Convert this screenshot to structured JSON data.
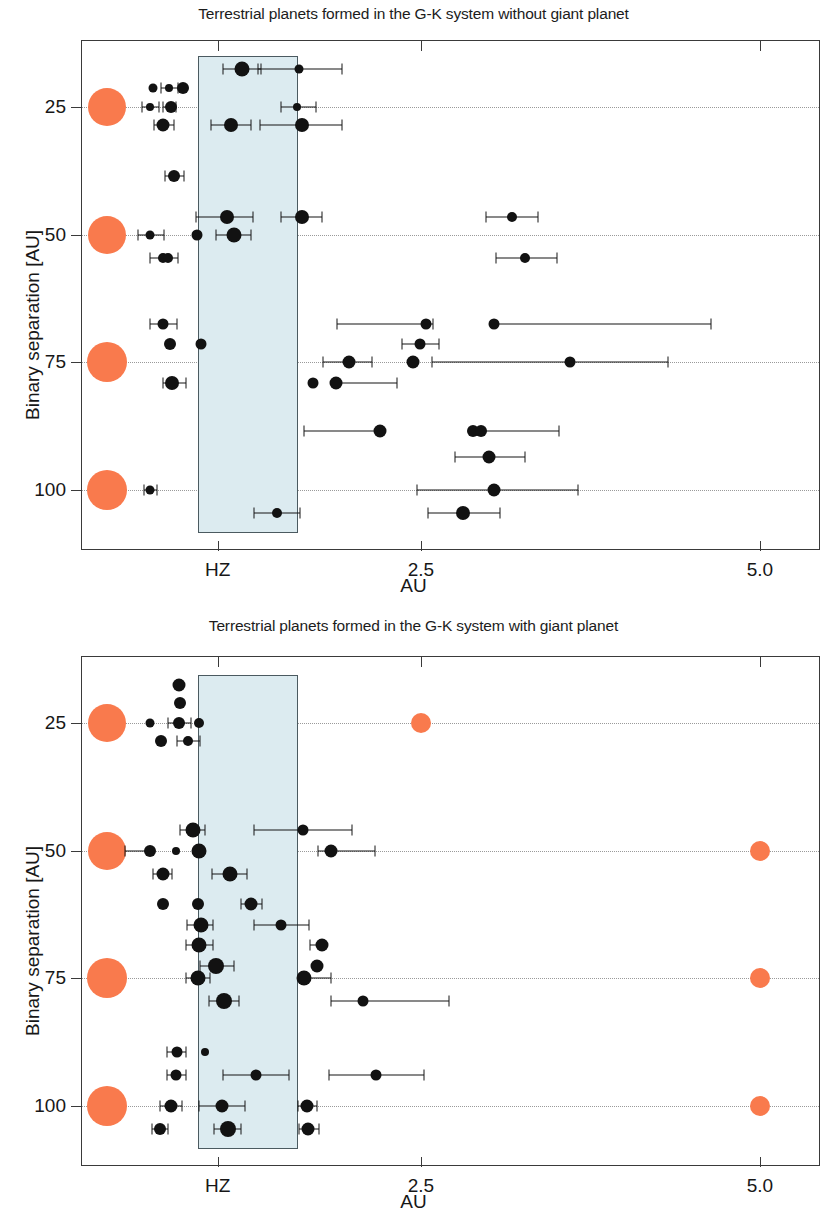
{
  "figure": {
    "axis": {
      "xlabel": "AU",
      "ylabel": "Binary separation [AU]",
      "xticks": [
        {
          "label": "HZ",
          "value": 1.0
        },
        {
          "label": "2.5",
          "value": 2.5
        },
        {
          "label": "5.0",
          "value": 5.0
        }
      ],
      "yticks": [
        {
          "label": "25",
          "value": 25
        },
        {
          "label": "50",
          "value": 50
        },
        {
          "label": "75",
          "value": 75
        },
        {
          "label": "100",
          "value": 100
        }
      ]
    },
    "colors": {
      "giant_planet": "#f97a4d",
      "habitable_zone_fill": "#dcebf0",
      "habitable_zone_border": "#4b5a60",
      "terrestrial_planet": "#121212",
      "axis": "#3a3a3a",
      "gridline": "#9a9a9a"
    }
  },
  "chart_data": [
    {
      "type": "scatter",
      "title": "Terrestrial planets formed in the G-K system without giant planet",
      "xlabel": "AU",
      "ylabel": "Binary separation [AU]",
      "xlim": [
        0.0,
        5.45
      ],
      "ylim": [
        112.0,
        12.0
      ],
      "grid": true,
      "legend": null,
      "habitable_zone": {
        "xmin": 0.855,
        "xmax": 1.59,
        "ymin": 15.0,
        "ymax": 108.5
      },
      "series": [
        {
          "name": "central star",
          "marker": "circle",
          "color": "#f97a4d",
          "points": [
            {
              "x": 0.185,
              "y": 25,
              "r": 19
            },
            {
              "x": 0.185,
              "y": 50,
              "r": 19
            },
            {
              "x": 0.185,
              "y": 75,
              "r": 20
            },
            {
              "x": 0.185,
              "y": 100,
              "r": 20
            }
          ]
        },
        {
          "name": "terrestrial planets",
          "marker": "circle",
          "color": "#121212",
          "points": [
            {
              "x": 1.18,
              "y": 17.5,
              "r": 7.5,
              "xerr_lo": 0.14,
              "xerr_hi": 0.14
            },
            {
              "x": 1.6,
              "y": 17.5,
              "r": 4.5,
              "xerr_lo": 0.3,
              "xerr_hi": 0.32
            },
            {
              "x": 0.525,
              "y": 21.2,
              "r": 4.5,
              "xerr_lo": 0.0,
              "xerr_hi": 0.0
            },
            {
              "x": 0.645,
              "y": 21.2,
              "r": 4.0,
              "xerr_lo": 0.06,
              "xerr_hi": 0.06
            },
            {
              "x": 0.745,
              "y": 21.2,
              "r": 6.0,
              "xerr_lo": 0.0,
              "xerr_hi": 0.0
            },
            {
              "x": 0.5,
              "y": 25,
              "r": 4.0,
              "xerr_lo": 0.06,
              "xerr_hi": 0.07
            },
            {
              "x": 0.655,
              "y": 25,
              "r": 6.0,
              "xerr_lo": 0.06,
              "xerr_hi": 0.04
            },
            {
              "x": 1.585,
              "y": 25,
              "r": 4.0,
              "xerr_lo": 0.12,
              "xerr_hi": 0.14
            },
            {
              "x": 0.6,
              "y": 28.5,
              "r": 6.5,
              "xerr_lo": 0.07,
              "xerr_hi": 0.08
            },
            {
              "x": 1.1,
              "y": 28.5,
              "r": 7.0,
              "xerr_lo": 0.15,
              "xerr_hi": 0.15
            },
            {
              "x": 1.62,
              "y": 28.5,
              "r": 7.0,
              "xerr_lo": 0.31,
              "xerr_hi": 0.3
            },
            {
              "x": 0.68,
              "y": 38.5,
              "r": 6.0,
              "xerr_lo": 0.07,
              "xerr_hi": 0.07
            },
            {
              "x": 1.07,
              "y": 46.5,
              "r": 7.0,
              "xerr_lo": 0.23,
              "xerr_hi": 0.19
            },
            {
              "x": 1.62,
              "y": 46.5,
              "r": 7.0,
              "xerr_lo": 0.15,
              "xerr_hi": 0.15
            },
            {
              "x": 3.17,
              "y": 46.5,
              "r": 5.0,
              "xerr_lo": 0.19,
              "xerr_hi": 0.19
            },
            {
              "x": 0.505,
              "y": 50,
              "r": 4.5,
              "xerr_lo": 0.09,
              "xerr_hi": 0.1
            },
            {
              "x": 0.845,
              "y": 50,
              "r": 5.5,
              "xerr_lo": 0.0,
              "xerr_hi": 0.0
            },
            {
              "x": 1.12,
              "y": 50,
              "r": 7.5,
              "xerr_lo": 0.13,
              "xerr_hi": 0.13
            },
            {
              "x": 0.6,
              "y": 54.5,
              "r": 5.0,
              "xerr_lo": 0.1,
              "xerr_hi": 0.11
            },
            {
              "x": 0.635,
              "y": 54.5,
              "r": 5.0,
              "xerr_lo": 0.0,
              "xerr_hi": 0.0
            },
            {
              "x": 3.27,
              "y": 54.5,
              "r": 5.0,
              "xerr_lo": 0.22,
              "xerr_hi": 0.23
            },
            {
              "x": 0.6,
              "y": 67.5,
              "r": 5.5,
              "xerr_lo": 0.1,
              "xerr_hi": 0.1
            },
            {
              "x": 2.54,
              "y": 67.5,
              "r": 5.5,
              "xerr_lo": 0.66,
              "xerr_hi": 0.05
            },
            {
              "x": 3.04,
              "y": 67.5,
              "r": 5.5,
              "xerr_lo": 0.0,
              "xerr_hi": 1.6
            },
            {
              "x": 0.65,
              "y": 71.5,
              "r": 6.0,
              "xerr_lo": 0.0,
              "xerr_hi": 0.0
            },
            {
              "x": 0.88,
              "y": 71.5,
              "r": 5.5,
              "xerr_lo": 0.0,
              "xerr_hi": 0.0
            },
            {
              "x": 2.49,
              "y": 71.5,
              "r": 5.5,
              "xerr_lo": 0.13,
              "xerr_hi": 0.14
            },
            {
              "x": 1.97,
              "y": 75,
              "r": 6.5,
              "xerr_lo": 0.19,
              "xerr_hi": 0.17
            },
            {
              "x": 2.44,
              "y": 75,
              "r": 6.5,
              "xerr_lo": 0.0,
              "xerr_hi": 0.0
            },
            {
              "x": 3.6,
              "y": 75,
              "r": 5.5,
              "xerr_lo": 1.02,
              "xerr_hi": 0.72
            },
            {
              "x": 0.665,
              "y": 79.0,
              "r": 7.0,
              "xerr_lo": 0.07,
              "xerr_hi": 0.1
            },
            {
              "x": 1.7,
              "y": 79.0,
              "r": 5.5,
              "xerr_lo": 0.0,
              "xerr_hi": 0.0
            },
            {
              "x": 1.87,
              "y": 79.0,
              "r": 6.5,
              "xerr_lo": 0.0,
              "xerr_hi": 0.45
            },
            {
              "x": 2.2,
              "y": 88.5,
              "r": 6.5,
              "xerr_lo": 0.56,
              "xerr_hi": 0.0
            },
            {
              "x": 2.88,
              "y": 88.5,
              "r": 6.0,
              "xerr_lo": 0.0,
              "xerr_hi": 0.0
            },
            {
              "x": 2.94,
              "y": 88.5,
              "r": 6.0,
              "xerr_lo": 0.0,
              "xerr_hi": 0.58
            },
            {
              "x": 3.0,
              "y": 93.5,
              "r": 6.5,
              "xerr_lo": 0.25,
              "xerr_hi": 0.27
            },
            {
              "x": 0.505,
              "y": 100,
              "r": 4.5,
              "xerr_lo": 0.05,
              "xerr_hi": 0.05
            },
            {
              "x": 3.04,
              "y": 100,
              "r": 6.5,
              "xerr_lo": 0.57,
              "xerr_hi": 0.62
            },
            {
              "x": 1.44,
              "y": 104.5,
              "r": 5.0,
              "xerr_lo": 0.17,
              "xerr_hi": 0.17
            },
            {
              "x": 2.81,
              "y": 104.5,
              "r": 7.0,
              "xerr_lo": 0.26,
              "xerr_hi": 0.27
            }
          ]
        }
      ]
    },
    {
      "type": "scatter",
      "title": "Terrestrial planets formed in the G-K system with giant planet",
      "xlabel": "AU",
      "ylabel": "Binary separation [AU]",
      "xlim": [
        0.0,
        5.45
      ],
      "ylim": [
        112.0,
        12.0
      ],
      "grid": true,
      "legend": null,
      "habitable_zone": {
        "xmin": 0.855,
        "xmax": 1.59,
        "ymin": 15.5,
        "ymax": 108.5
      },
      "series": [
        {
          "name": "central star",
          "marker": "circle",
          "color": "#f97a4d",
          "points": [
            {
              "x": 0.185,
              "y": 25,
              "r": 19
            },
            {
              "x": 0.185,
              "y": 50,
              "r": 19
            },
            {
              "x": 0.185,
              "y": 75,
              "r": 20
            },
            {
              "x": 0.185,
              "y": 100,
              "r": 20
            }
          ]
        },
        {
          "name": "giant planets",
          "marker": "circle",
          "color": "#f97a4d",
          "points": [
            {
              "x": 2.5,
              "y": 25,
              "r": 10
            },
            {
              "x": 5.0,
              "y": 50,
              "r": 10
            },
            {
              "x": 5.0,
              "y": 75,
              "r": 10
            },
            {
              "x": 5.0,
              "y": 100,
              "r": 10
            }
          ]
        },
        {
          "name": "terrestrial planets",
          "marker": "circle",
          "color": "#121212",
          "points": [
            {
              "x": 0.715,
              "y": 17.5,
              "r": 6.5,
              "xerr_lo": 0.0,
              "xerr_hi": 0.0
            },
            {
              "x": 0.725,
              "y": 21.0,
              "r": 6.0,
              "xerr_lo": 0.0,
              "xerr_hi": 0.0
            },
            {
              "x": 0.5,
              "y": 25,
              "r": 4.5,
              "xerr_lo": 0.0,
              "xerr_hi": 0.0
            },
            {
              "x": 0.715,
              "y": 25,
              "r": 6.0,
              "xerr_lo": 0.08,
              "xerr_hi": 0.09
            },
            {
              "x": 0.86,
              "y": 25,
              "r": 5.0,
              "xerr_lo": 0.0,
              "xerr_hi": 0.0
            },
            {
              "x": 0.585,
              "y": 28.5,
              "r": 6.0,
              "xerr_lo": 0.0,
              "xerr_hi": 0.0
            },
            {
              "x": 0.78,
              "y": 28.5,
              "r": 5.0,
              "xerr_lo": 0.08,
              "xerr_hi": 0.09
            },
            {
              "x": 0.815,
              "y": 46.0,
              "r": 7.5,
              "xerr_lo": 0.09,
              "xerr_hi": 0.09
            },
            {
              "x": 1.63,
              "y": 46.0,
              "r": 5.5,
              "xerr_lo": 0.36,
              "xerr_hi": 0.36
            },
            {
              "x": 0.5,
              "y": 50,
              "r": 6.0,
              "xerr_lo": 0.18,
              "xerr_hi": 0.0
            },
            {
              "x": 0.695,
              "y": 50,
              "r": 4.0,
              "xerr_lo": 0.0,
              "xerr_hi": 0.0
            },
            {
              "x": 0.865,
              "y": 50,
              "r": 7.5,
              "xerr_lo": 0.0,
              "xerr_hi": 0.0
            },
            {
              "x": 1.84,
              "y": 50,
              "r": 6.5,
              "xerr_lo": 0.1,
              "xerr_hi": 0.32
            },
            {
              "x": 0.595,
              "y": 54.5,
              "r": 6.5,
              "xerr_lo": 0.07,
              "xerr_hi": 0.07
            },
            {
              "x": 1.09,
              "y": 54.5,
              "r": 7.5,
              "xerr_lo": 0.13,
              "xerr_hi": 0.13
            },
            {
              "x": 0.6,
              "y": 60.5,
              "r": 6.0,
              "xerr_lo": 0.0,
              "xerr_hi": 0.0
            },
            {
              "x": 0.855,
              "y": 60.5,
              "r": 6.0,
              "xerr_lo": 0.0,
              "xerr_hi": 0.0
            },
            {
              "x": 1.245,
              "y": 60.5,
              "r": 6.5,
              "xerr_lo": 0.07,
              "xerr_hi": 0.08
            },
            {
              "x": 0.875,
              "y": 64.5,
              "r": 7.5,
              "xerr_lo": 0.1,
              "xerr_hi": 0.09
            },
            {
              "x": 1.465,
              "y": 64.5,
              "r": 5.5,
              "xerr_lo": 0.2,
              "xerr_hi": 0.21
            },
            {
              "x": 0.865,
              "y": 68.5,
              "r": 7.5,
              "xerr_lo": 0.1,
              "xerr_hi": 0.1
            },
            {
              "x": 1.77,
              "y": 68.5,
              "r": 6.5,
              "xerr_lo": 0.09,
              "xerr_hi": 0.0
            },
            {
              "x": 0.99,
              "y": 72.5,
              "r": 8.0,
              "xerr_lo": 0.12,
              "xerr_hi": 0.13
            },
            {
              "x": 1.73,
              "y": 72.5,
              "r": 6.5,
              "xerr_lo": 0.0,
              "xerr_hi": 0.0
            },
            {
              "x": 0.855,
              "y": 75,
              "r": 7.5,
              "xerr_lo": 0.09,
              "xerr_hi": 0.09
            },
            {
              "x": 1.64,
              "y": 75,
              "r": 7.5,
              "xerr_lo": 0.0,
              "xerr_hi": 0.2
            },
            {
              "x": 1.05,
              "y": 79.5,
              "r": 8.0,
              "xerr_lo": 0.11,
              "xerr_hi": 0.11
            },
            {
              "x": 2.07,
              "y": 79.5,
              "r": 5.5,
              "xerr_lo": 0.23,
              "xerr_hi": 0.64
            },
            {
              "x": 0.7,
              "y": 89.5,
              "r": 5.5,
              "xerr_lo": 0.07,
              "xerr_hi": 0.07
            },
            {
              "x": 0.905,
              "y": 89.5,
              "r": 4.0,
              "xerr_lo": 0.0,
              "xerr_hi": 0.0
            },
            {
              "x": 0.695,
              "y": 94.0,
              "r": 5.5,
              "xerr_lo": 0.07,
              "xerr_hi": 0.07
            },
            {
              "x": 1.28,
              "y": 94.0,
              "r": 5.5,
              "xerr_lo": 0.24,
              "xerr_hi": 0.25
            },
            {
              "x": 2.17,
              "y": 94.0,
              "r": 5.5,
              "xerr_lo": 0.35,
              "xerr_hi": 0.35
            },
            {
              "x": 0.655,
              "y": 100,
              "r": 6.5,
              "xerr_lo": 0.08,
              "xerr_hi": 0.08
            },
            {
              "x": 1.03,
              "y": 100,
              "r": 6.5,
              "xerr_lo": 0.17,
              "xerr_hi": 0.17
            },
            {
              "x": 1.66,
              "y": 100,
              "r": 6.5,
              "xerr_lo": 0.07,
              "xerr_hi": 0.07
            },
            {
              "x": 0.575,
              "y": 104.5,
              "r": 6.0,
              "xerr_lo": 0.06,
              "xerr_hi": 0.06
            },
            {
              "x": 1.075,
              "y": 104.5,
              "r": 8.0,
              "xerr_lo": 0.1,
              "xerr_hi": 0.1
            },
            {
              "x": 1.67,
              "y": 104.5,
              "r": 6.5,
              "xerr_lo": 0.07,
              "xerr_hi": 0.08
            }
          ]
        }
      ]
    }
  ]
}
